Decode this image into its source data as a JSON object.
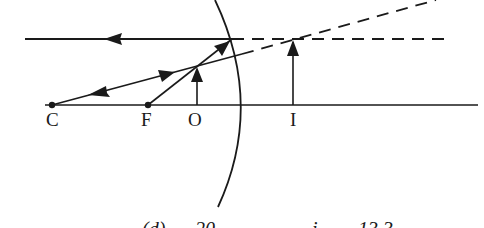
{
  "diagram": {
    "type": "ray-diagram-convex-mirror",
    "labels": {
      "center_of_curvature": "C",
      "focal_point": "F",
      "object": "O",
      "image": "I"
    },
    "caption_partial": {
      "part1": "(d)",
      "part2": "20",
      "part3": "i",
      "part4": "13.3"
    },
    "colors": {
      "line": "#1a1a1a",
      "background": "#ffffff"
    }
  }
}
